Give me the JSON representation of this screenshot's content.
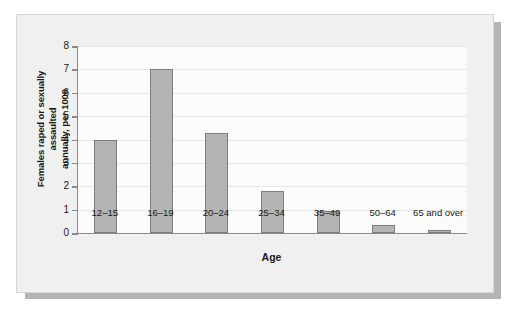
{
  "figure": {
    "background_color": "#f0f0f0",
    "plot_background_color": "#fbfbfb",
    "bar_fill_color": "#b4b4b4",
    "bar_border_color": "#7d7d7d",
    "axis_color": "#8a8a8a",
    "gridline_color": "#e6e6e6"
  },
  "chart_data": {
    "type": "bar",
    "title": "",
    "xlabel": "Age",
    "ylabel": "Females raped or sexually assaulted annually, per 1000",
    "ylabel_line1": "Females raped or sexually assaulted",
    "ylabel_line2": "annually, per 1000",
    "categories": [
      "12–15",
      "16–19",
      "20–24",
      "25–34",
      "35–49",
      "50–64",
      "65 and over"
    ],
    "values": [
      4.0,
      7.0,
      4.3,
      1.8,
      0.95,
      0.35,
      0.15
    ],
    "ylim": [
      0,
      8
    ],
    "ytick_labels": [
      "0",
      "1",
      "2",
      "3",
      "4",
      "5",
      "6",
      "7",
      "8"
    ],
    "ytick_values": [
      0,
      1,
      2,
      3,
      4,
      5,
      6,
      7,
      8
    ],
    "grid": true,
    "grid_axis": "y",
    "legend": false
  }
}
